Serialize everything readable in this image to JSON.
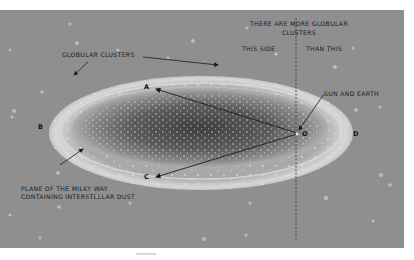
{
  "diagram": {
    "labels": {
      "globular_clusters": "GLOBULAR CLUSTERS",
      "more_clusters_line1": "THERE ARE MORE GLOBULAR",
      "more_clusters_line2": "CLUSTERS",
      "this_side": "THIS  SIDE",
      "than_this": "THAN THIS",
      "sun_and_earth": "SUN AND EARTH",
      "plane_line1": "PLANE OF THE MILKY WAY",
      "plane_line2": "CONTAINING INTERSTELLAR DUST"
    },
    "points": {
      "A": "A",
      "B": "B",
      "C": "C",
      "D": "D",
      "O": "O"
    },
    "colors": {
      "background": "#8f8f8f",
      "galaxy_core": "#4a4a4a",
      "galaxy_rim": "#d4d4d4",
      "ink": "#1c1c1c"
    }
  }
}
